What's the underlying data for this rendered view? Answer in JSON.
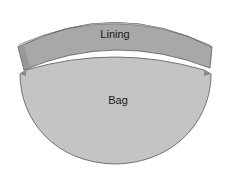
{
  "diagram": {
    "labels": {
      "lining": "Lining",
      "bag": "Bag"
    },
    "colors": {
      "lining_fill": "#a8a8a8",
      "lining_edge": "#d6d6d6",
      "bag_fill": "#c4c4c4",
      "outline": "#555555",
      "shadow": "#8a8a8a"
    }
  }
}
